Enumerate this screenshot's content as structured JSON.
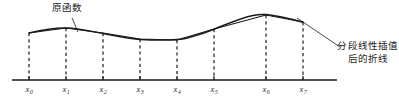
{
  "figure": {
    "title": "",
    "annotations": {
      "original_function": "原函数",
      "interpolated_polyline": "分段线性插值后的折线"
    },
    "axis": {
      "x_start": 12,
      "x_end": 337,
      "y": 80,
      "tick_height": 4
    },
    "nodes": [
      {
        "label": "x",
        "sub": "0",
        "x": 29,
        "y": 33
      },
      {
        "label": "x",
        "sub": "1",
        "x": 66,
        "y": 28
      },
      {
        "label": "x",
        "sub": "2",
        "x": 103,
        "y": 33
      },
      {
        "label": "x",
        "sub": "3",
        "x": 140,
        "y": 39
      },
      {
        "label": "x",
        "sub": "4",
        "x": 177,
        "y": 40
      },
      {
        "label": "x",
        "sub": "5",
        "x": 214,
        "y": 29
      },
      {
        "label": "x",
        "sub": "6",
        "x": 266,
        "y": 15
      },
      {
        "label": "x",
        "sub": "7",
        "x": 303,
        "y": 22
      }
    ],
    "curve": {
      "type": "smooth-original-function",
      "path": "M 29 33 C 41 30.2, 54 27.8, 66 28 C 78 28.2, 91 31.2, 103 33.6 C 115 36.0, 128 38.6, 140 39.4 C 152 40.2, 165 40.4, 177 39.6 C 189 38.6, 202 33.8, 214 29.2 C 227 24.2, 240 18.0, 253 15.4 C 258 14.4, 262 14.2, 266 14.6 C 276 15.6, 290 18.8, 303 22.2"
    },
    "polyline": {
      "type": "piecewise-linear-interpolant",
      "points": "29,33 66,28 103,33 140,39 177,40 214,29 266,15 303,22"
    },
    "leaders": [
      {
        "name": "leader-original",
        "path": "M 72 18 L 78 32"
      },
      {
        "name": "leader-polyline",
        "path": "M 297 18 L 340 47"
      }
    ],
    "colors": {
      "ink": "#1a1a1a",
      "curve": "#1b1b1b",
      "dash": "#2b2b2b",
      "background": "#ffffff"
    }
  }
}
